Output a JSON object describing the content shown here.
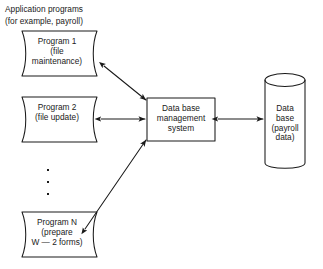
{
  "diagram": {
    "header_caption": "Application programs\n(for example, payroll)",
    "stroke_color": "#1a1a1a",
    "background_color": "#ffffff",
    "nodes": {
      "program_1": {
        "shape": "tape",
        "label": "Program 1\n(file\nmaintenance)"
      },
      "program_2": {
        "shape": "tape",
        "label": "Program 2\n(file update)"
      },
      "program_n": {
        "shape": "tape",
        "label": "Program N\n(prepare\nW — 2 forms)"
      },
      "dbms": {
        "shape": "rectangle",
        "label": "Data base\nmanagement\nsystem"
      },
      "database": {
        "shape": "cylinder",
        "label": "Data\nbase\n(payroll\ndata)"
      }
    },
    "ellipsis": {
      "symbol": "vertical-ellipsis",
      "dot_count": 3
    },
    "connectors": [
      {
        "name": "program-1-to-dbms",
        "from": "program_1",
        "to": "dbms",
        "style": "double-headed",
        "orientation": "diagonal"
      },
      {
        "name": "program-2-to-dbms",
        "from": "program_2",
        "to": "dbms",
        "style": "double-headed",
        "orientation": "horizontal"
      },
      {
        "name": "program-n-to-dbms",
        "from": "program_n",
        "to": "dbms",
        "style": "double-headed",
        "orientation": "diagonal"
      },
      {
        "name": "dbms-to-database",
        "from": "dbms",
        "to": "database",
        "style": "double-headed",
        "orientation": "horizontal"
      }
    ]
  }
}
